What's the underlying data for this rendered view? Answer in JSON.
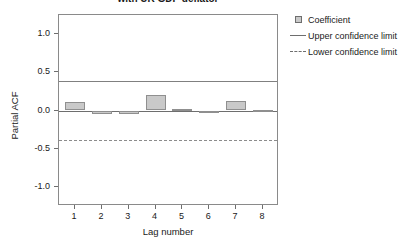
{
  "chart_data": {
    "type": "bar",
    "title": "with UK GDP deflator",
    "xlabel": "Lag number",
    "ylabel": "Partial ACF",
    "categories": [
      "1",
      "2",
      "3",
      "4",
      "5",
      "6",
      "7",
      "8"
    ],
    "values": [
      0.11,
      -0.05,
      -0.05,
      0.2,
      0.02,
      -0.03,
      0.13,
      0.01
    ],
    "series": [
      {
        "name": "Coefficient",
        "values": [
          0.11,
          -0.05,
          -0.05,
          0.2,
          0.02,
          -0.03,
          0.13,
          0.01
        ]
      }
    ],
    "ylim": [
      -1.25,
      1.25
    ],
    "xlim": [
      0.4,
      8.6
    ],
    "yticks": [
      1.0,
      0.5,
      0.0,
      -0.5,
      -1.0
    ],
    "ytick_labels": [
      "1.0",
      "0.5",
      "0.0",
      "-0.5",
      "-1.0"
    ],
    "xticks": [
      1,
      2,
      3,
      4,
      5,
      6,
      7,
      8
    ],
    "xtick_labels": [
      "1",
      "2",
      "3",
      "4",
      "5",
      "6",
      "7",
      "8"
    ],
    "upper_confidence_limit": 0.38,
    "lower_confidence_limit": -0.38,
    "grid": false,
    "legend_position": "right",
    "bar_color": "#c9c9c9",
    "bar_border_color": "#8f8f8f",
    "axis_color": "#6e6e6e"
  },
  "legend": {
    "items": [
      {
        "label": "Coefficient",
        "key": "square-marker"
      },
      {
        "label": "Upper confidence limit",
        "key": "solid-line"
      },
      {
        "label": "Lower confidence limit",
        "key": "dashed-line"
      }
    ]
  }
}
